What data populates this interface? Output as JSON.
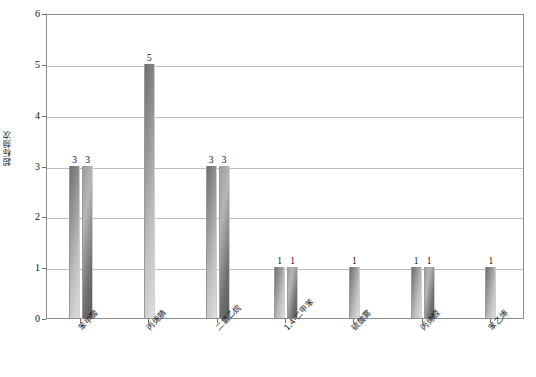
{
  "chart_data": {
    "type": "bar",
    "title": "",
    "xlabel": "",
    "ylabel": "超标频次",
    "ylim": [
      0,
      6
    ],
    "yticks": [
      "0",
      "1",
      "2",
      "3",
      "4",
      "5",
      "6"
    ],
    "grid": true,
    "legend": "none",
    "categories": [
      "苯甲酸",
      "丙烯腈",
      "二氯乙烷",
      "1,4-二甲苯",
      "硫酸雾",
      "丙烯醛",
      "苯乙烯"
    ],
    "groups": [
      {
        "category": "苯甲酸",
        "values": [
          3,
          3
        ],
        "labels": [
          "3",
          "3"
        ]
      },
      {
        "category": "丙烯腈",
        "values": [
          5
        ],
        "labels": [
          "5"
        ]
      },
      {
        "category": "二氯乙烷",
        "values": [
          3,
          3
        ],
        "labels": [
          "3",
          "3"
        ]
      },
      {
        "category": "1,4-二甲苯",
        "values": [
          1,
          1
        ],
        "labels": [
          "1",
          "1"
        ]
      },
      {
        "category": "硫酸雾",
        "values": [
          1
        ],
        "labels": [
          "1"
        ]
      },
      {
        "category": "丙烯醛",
        "values": [
          1,
          1
        ],
        "labels": [
          "1",
          "1"
        ]
      },
      {
        "category": "苯乙烯",
        "values": [
          1
        ],
        "labels": [
          "1"
        ]
      }
    ],
    "colors": {
      "bar_dark": "#6f6f6f",
      "bar_light": "#dedede",
      "gridline": "#bdbdbd",
      "frame": "#8d8d8d",
      "text": "#1a1a1a"
    }
  }
}
